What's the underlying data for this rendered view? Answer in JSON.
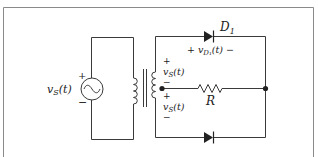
{
  "diagram": {
    "type": "circuit",
    "source_label": "v_S(t)",
    "source_plus": "+",
    "source_minus": "−",
    "secondary_upper": {
      "plus": "+",
      "label": "v_S(t)",
      "minus": "−"
    },
    "secondary_lower": {
      "plus": "+",
      "label": "v_S(t)",
      "minus": "−"
    },
    "diode_top": {
      "name": "D",
      "subscript": "1",
      "voltage_label": "+ v_D₁(t) −"
    },
    "diode_bottom": {
      "name": ""
    },
    "resistor_label": "R",
    "colors": {
      "wire": "#3a3a3a",
      "frame": "#8a8a8a"
    }
  }
}
